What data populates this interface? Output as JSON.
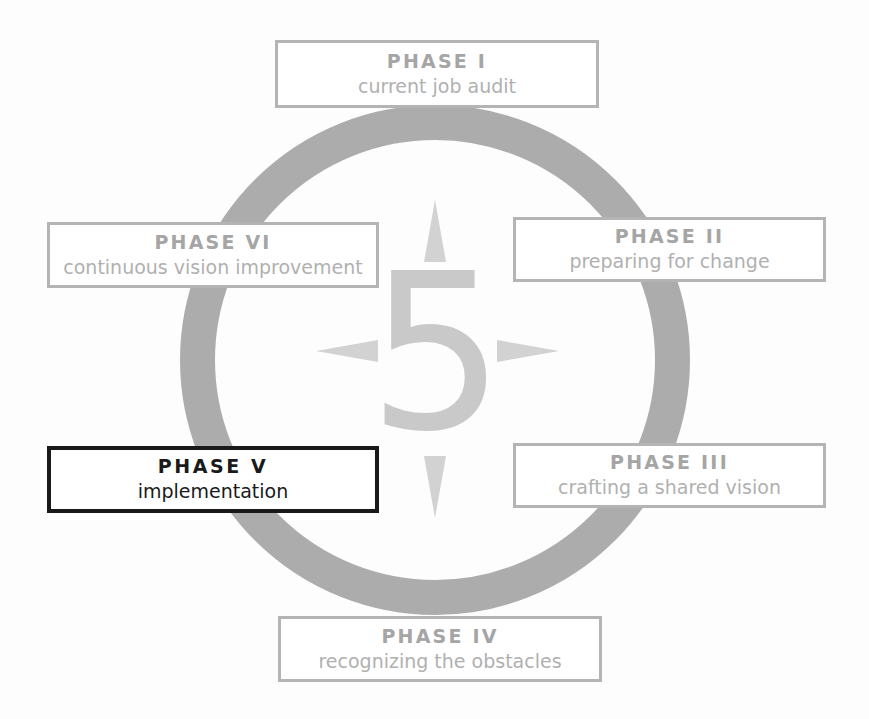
{
  "diagram": {
    "type": "cycle",
    "center_label": "5",
    "colors": {
      "ring": "#a9a9a9",
      "box_border": "#b4b4b4",
      "box_text": "#a5a5a5",
      "active_border": "#1a1a1a",
      "active_text": "#1a1a1a",
      "arrow": "#d2d2d2",
      "background": "#ffffff"
    },
    "phases": [
      {
        "id": "phase-1",
        "title": "PHASE I",
        "subtitle": "current job audit",
        "position": "top",
        "active": false
      },
      {
        "id": "phase-2",
        "title": "PHASE II",
        "subtitle": "preparing for change",
        "position": "right-upper",
        "active": false
      },
      {
        "id": "phase-3",
        "title": "PHASE III",
        "subtitle": "crafting a shared vision",
        "position": "right-lower",
        "active": false
      },
      {
        "id": "phase-4",
        "title": "PHASE IV",
        "subtitle": "recognizing the obstacles",
        "position": "bottom",
        "active": false
      },
      {
        "id": "phase-5",
        "title": "PHASE  V",
        "subtitle": "implementation",
        "position": "left-lower",
        "active": true
      },
      {
        "id": "phase-6",
        "title": "PHASE VI",
        "subtitle": "continuous vision improvement",
        "position": "left-upper",
        "active": false
      }
    ],
    "arrows": [
      {
        "name": "arrow-up-icon",
        "direction": "up"
      },
      {
        "name": "arrow-right-icon",
        "direction": "right"
      },
      {
        "name": "arrow-down-icon",
        "direction": "down"
      },
      {
        "name": "arrow-left-icon",
        "direction": "left"
      }
    ]
  }
}
